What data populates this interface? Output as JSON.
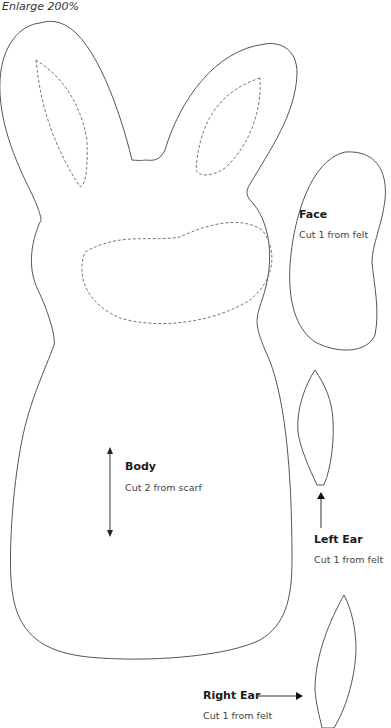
{
  "header": {
    "caption": "Enlarge 200%"
  },
  "pieces": [
    {
      "id": "body",
      "title": "Body",
      "instruction": "Cut 2 from scarf",
      "grainline": "vertical-double-arrow"
    },
    {
      "id": "face",
      "title": "Face",
      "instruction": "Cut 1 from felt"
    },
    {
      "id": "left-ear",
      "title": "Left Ear",
      "instruction": "Cut 1 from felt",
      "pointer": "arrow-up"
    },
    {
      "id": "right-ear",
      "title": "Right Ear",
      "instruction": "Cut 1 from felt",
      "pointer": "arrow-right"
    }
  ],
  "colors": {
    "outline": "#555555",
    "dashed": "#777777",
    "text": "#1a1a1a"
  }
}
